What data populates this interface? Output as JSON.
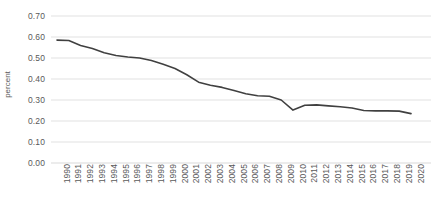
{
  "chart_data": {
    "type": "line",
    "title": "",
    "xlabel": "",
    "ylabel": "percent",
    "ylim": [
      0.0,
      0.7
    ],
    "ytick_labels": [
      "0.00",
      "0.10",
      "0.20",
      "0.30",
      "0.40",
      "0.50",
      "0.60",
      "0.70"
    ],
    "ytick_values": [
      0.0,
      0.1,
      0.2,
      0.3,
      0.4,
      0.5,
      0.6,
      0.7
    ],
    "grid": "horizontal",
    "legend": "none",
    "line_color": "#404040",
    "categories": [
      "1990",
      "1991",
      "1992",
      "1993",
      "1994",
      "1995",
      "1996",
      "1997",
      "1998",
      "1999",
      "2000",
      "2001",
      "2002",
      "2003",
      "2004",
      "2005",
      "2006",
      "2007",
      "2008",
      "2009",
      "2010",
      "2011",
      "2012",
      "2013",
      "2014",
      "2015",
      "2016",
      "2017",
      "2018",
      "2019",
      "2020"
    ],
    "values": [
      0.585,
      0.583,
      0.56,
      0.545,
      0.525,
      0.512,
      0.505,
      0.5,
      0.488,
      0.47,
      0.45,
      0.42,
      0.385,
      0.37,
      0.36,
      0.345,
      0.33,
      0.32,
      0.318,
      0.3,
      0.252,
      0.275,
      0.277,
      0.272,
      0.268,
      0.262,
      0.25,
      0.248,
      0.248,
      0.247,
      0.235
    ]
  }
}
